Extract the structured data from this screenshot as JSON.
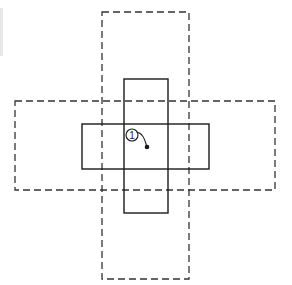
{
  "diagram": {
    "width": 292,
    "height": 285,
    "colors": {
      "background": "#ffffff",
      "stroke": "#1a1a1a",
      "dashed_stroke": "#333333"
    },
    "outer_dashed_rects": [
      {
        "name": "outer-vertical-region",
        "x": 102,
        "y": 12,
        "w": 87,
        "h": 267
      },
      {
        "name": "outer-horizontal-region",
        "x": 15,
        "y": 101,
        "w": 260,
        "h": 89
      }
    ],
    "inner_solid_rects": [
      {
        "name": "inner-vertical-region",
        "x": 124,
        "y": 79,
        "w": 44,
        "h": 134
      },
      {
        "name": "inner-horizontal-region",
        "x": 82,
        "y": 124,
        "w": 127,
        "h": 45
      }
    ],
    "callout": {
      "label": "1",
      "circle": {
        "cx": 132,
        "cy": 135,
        "r": 6
      },
      "point": {
        "x": 147,
        "y": 147
      }
    }
  }
}
